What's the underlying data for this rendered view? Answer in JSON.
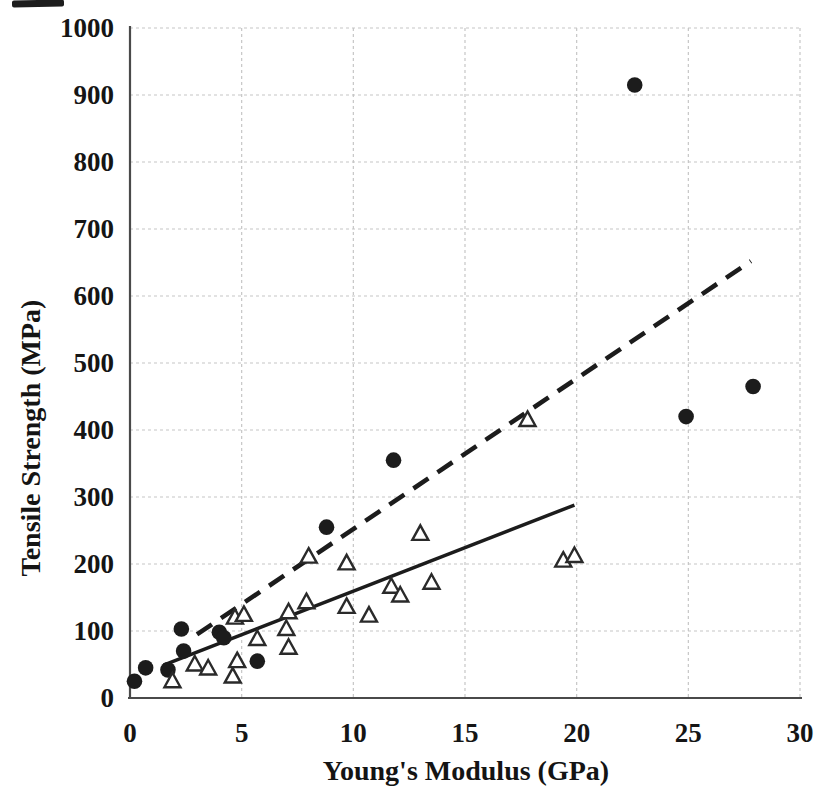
{
  "chart_data": {
    "type": "scatter",
    "title": "",
    "xlabel": "Young's Modulus (GPa)",
    "ylabel": "Tensile Strength (MPa)",
    "xlim": [
      0,
      30
    ],
    "ylim": [
      0,
      1000
    ],
    "x_ticks": [
      0,
      5,
      10,
      15,
      20,
      25,
      30
    ],
    "y_ticks": [
      0,
      100,
      200,
      300,
      400,
      500,
      600,
      700,
      800,
      900,
      1000
    ],
    "grid": true,
    "legend_position": "none",
    "series": [
      {
        "name": "filled-circle-series",
        "marker": "circle",
        "color": "#1c1c1c",
        "points": [
          [
            0.2,
            25
          ],
          [
            0.7,
            45
          ],
          [
            1.7,
            42
          ],
          [
            2.3,
            103
          ],
          [
            2.4,
            70
          ],
          [
            4.0,
            98
          ],
          [
            4.2,
            90
          ],
          [
            5.7,
            55
          ],
          [
            8.8,
            255
          ],
          [
            11.8,
            355
          ],
          [
            22.6,
            915
          ],
          [
            24.9,
            420
          ],
          [
            27.9,
            465
          ]
        ],
        "trendline": {
          "style": "dashed",
          "from": [
            3.0,
            95
          ],
          "to": [
            27.8,
            652
          ]
        }
      },
      {
        "name": "open-triangle-series",
        "marker": "triangle-open",
        "color": "#2a2a2a",
        "points": [
          [
            1.9,
            25
          ],
          [
            2.9,
            50
          ],
          [
            3.5,
            44
          ],
          [
            4.6,
            32
          ],
          [
            4.8,
            55
          ],
          [
            4.7,
            120
          ],
          [
            5.1,
            124
          ],
          [
            5.7,
            88
          ],
          [
            7.0,
            103
          ],
          [
            7.1,
            128
          ],
          [
            7.1,
            75
          ],
          [
            7.9,
            143
          ],
          [
            8.0,
            211
          ],
          [
            9.7,
            201
          ],
          [
            9.7,
            136
          ],
          [
            10.7,
            123
          ],
          [
            11.7,
            166
          ],
          [
            12.1,
            153
          ],
          [
            13.0,
            245
          ],
          [
            13.5,
            172
          ],
          [
            17.8,
            415
          ],
          [
            19.4,
            205
          ],
          [
            19.9,
            212
          ]
        ],
        "trendline": {
          "style": "solid",
          "from": [
            1.5,
            49
          ],
          "to": [
            19.9,
            288
          ]
        }
      }
    ],
    "colors": {
      "background": "#ffffff",
      "grid": "#c6c6c6",
      "axis": "#4a4a4a",
      "marker": "#1c1c1c",
      "tick_label": "#151515"
    }
  }
}
